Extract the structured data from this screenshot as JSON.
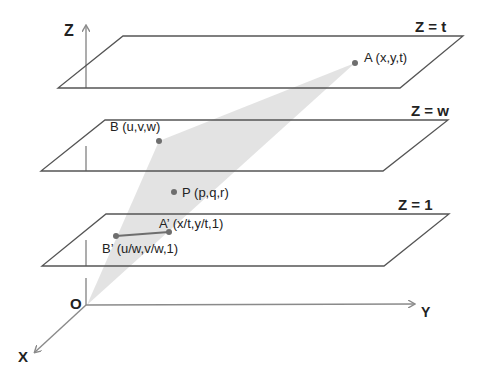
{
  "diagram": {
    "axes": {
      "z_label": "Z",
      "y_label": "Y",
      "x_label": "X",
      "origin_label": "O"
    },
    "planes": [
      {
        "id": "plane-z-t",
        "label": "Z = t"
      },
      {
        "id": "plane-z-w",
        "label": "Z = w"
      },
      {
        "id": "plane-z-1",
        "label": "Z = 1"
      }
    ],
    "points": {
      "A": {
        "label": "A (x,y,t)"
      },
      "B": {
        "label": "B (u,v,w)"
      },
      "P": {
        "label": "P (p,q,r)"
      },
      "A_prime": {
        "label": "A’ (x/t,y/t,1)"
      },
      "B_prime": {
        "label": "B’ (u/w,v/w,1)"
      }
    },
    "colors": {
      "plane_edge": "#555555",
      "axis": "#8a8a8a",
      "triangle_fill": "#d9d9d9",
      "point": "#6e6e6e",
      "segment": "#6e6e6e"
    }
  }
}
